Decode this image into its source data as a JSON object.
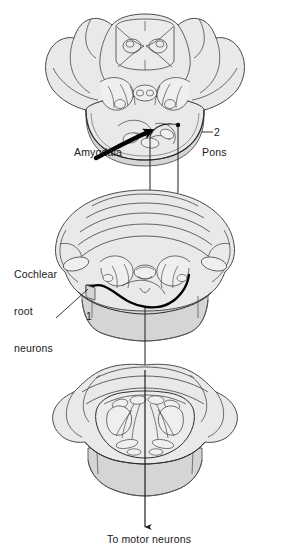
{
  "figure": {
    "type": "anatomical-diagram",
    "width": 283,
    "height": 554,
    "background_color": "#ffffff"
  },
  "labels": {
    "amygdala": "Amygdala",
    "pons": "Pons",
    "cochlear_line1": "Cochlear",
    "cochlear_line2": "root",
    "cochlear_line3": "neurons",
    "marker_one": "1",
    "marker_two": "2",
    "to_motor_neurons": "To motor neurons"
  },
  "sections": [
    {
      "name": "upper-brain-section",
      "description": "Coronal section through midbrain and rostral pons",
      "center_x": 145,
      "center_y": 90
    },
    {
      "name": "middle-brain-section",
      "description": "Coronal section through pons and cerebellum containing cochlear root neurons",
      "center_x": 145,
      "center_y": 265
    },
    {
      "name": "lower-brain-section",
      "description": "Coronal section through medulla projecting to motor neurons",
      "center_x": 145,
      "center_y": 440
    }
  ],
  "pathways": [
    {
      "name": "amygdala-projection-arrow",
      "style": "thick-solid-black-curved-arrow",
      "color": "#000000",
      "direction": "leftward-to-rightward-upward"
    },
    {
      "name": "cochlear-root-projection",
      "style": "thick-solid-black-curve",
      "color": "#000000",
      "direction": "left-to-right-ascending"
    },
    {
      "name": "descending-tract-to-motor-neurons",
      "style": "thin-vertical-line-with-arrowhead",
      "color": "#222222",
      "direction": "downward"
    }
  ],
  "colors": {
    "tissue_fill": "#e9e9e9",
    "tissue_fill_light": "#f1f1f1",
    "tissue_fill_shadow": "#d5d5d5",
    "outline": "#4a4a4a",
    "outline_dark": "#2b2b2b",
    "pathway": "#000000",
    "text": "#1a1a1a"
  }
}
